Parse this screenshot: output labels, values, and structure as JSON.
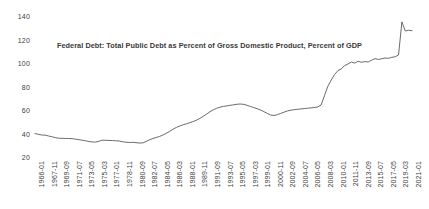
{
  "chart_data": {
    "type": "line",
    "title": "Federal Debt: Total Public Debt as Percent of Gross Domestic Product, Percent of GDP",
    "xlabel": "",
    "ylabel": "",
    "ylim": [
      20,
      140
    ],
    "yticks": [
      20,
      40,
      60,
      80,
      100,
      120,
      140
    ],
    "grid": false,
    "legend": "none",
    "line_color": "#595959",
    "xtick_labels": [
      "1966-01",
      "1967-11",
      "1969-09",
      "1971-07",
      "1973-05",
      "1975-03",
      "1977-01",
      "1978-11",
      "1980-09",
      "1982-07",
      "1984-05",
      "1986-03",
      "1988-01",
      "1989-11",
      "1991-09",
      "1993-07",
      "1995-05",
      "1997-03",
      "1999-01",
      "2000-11",
      "2002-09",
      "2004-07",
      "2006-05",
      "2008-03",
      "2010-01",
      "2011-11",
      "2013-09",
      "2015-07",
      "2017-05",
      "2019-03",
      "2021-01"
    ],
    "x": [
      "1966-01",
      "1966-07",
      "1967-01",
      "1967-07",
      "1968-01",
      "1968-07",
      "1969-01",
      "1969-07",
      "1970-01",
      "1970-07",
      "1971-01",
      "1971-07",
      "1972-01",
      "1972-07",
      "1973-01",
      "1973-07",
      "1974-01",
      "1974-07",
      "1975-01",
      "1975-07",
      "1976-01",
      "1976-07",
      "1977-01",
      "1977-07",
      "1978-01",
      "1978-07",
      "1979-01",
      "1979-07",
      "1980-01",
      "1980-07",
      "1981-01",
      "1981-07",
      "1982-01",
      "1982-07",
      "1983-01",
      "1983-07",
      "1984-01",
      "1984-07",
      "1985-01",
      "1985-07",
      "1986-01",
      "1986-07",
      "1987-01",
      "1987-07",
      "1988-01",
      "1988-07",
      "1989-01",
      "1989-07",
      "1990-01",
      "1990-07",
      "1991-01",
      "1991-07",
      "1992-01",
      "1992-07",
      "1993-01",
      "1993-07",
      "1994-01",
      "1994-07",
      "1995-01",
      "1995-07",
      "1996-01",
      "1996-07",
      "1997-01",
      "1997-07",
      "1998-01",
      "1998-07",
      "1999-01",
      "1999-07",
      "2000-01",
      "2000-07",
      "2001-01",
      "2001-07",
      "2002-01",
      "2002-07",
      "2003-01",
      "2003-07",
      "2004-01",
      "2004-07",
      "2005-01",
      "2005-07",
      "2006-01",
      "2006-07",
      "2007-01",
      "2007-07",
      "2008-01",
      "2008-07",
      "2009-01",
      "2009-07",
      "2010-01",
      "2010-07",
      "2011-01",
      "2011-07",
      "2012-01",
      "2012-07",
      "2013-01",
      "2013-07",
      "2014-01",
      "2014-07",
      "2015-01",
      "2015-07",
      "2016-01",
      "2016-07",
      "2017-01",
      "2017-07",
      "2018-01",
      "2018-07",
      "2019-01",
      "2019-07",
      "2020-01",
      "2020-04",
      "2020-07",
      "2020-10",
      "2021-01"
    ],
    "values": [
      40.0,
      39.3,
      38.7,
      38.6,
      37.9,
      37.3,
      36.5,
      36.0,
      35.9,
      35.8,
      35.8,
      35.6,
      35.2,
      34.8,
      34.3,
      33.8,
      33.2,
      32.8,
      32.7,
      33.4,
      34.3,
      34.2,
      34.1,
      34.0,
      33.8,
      33.6,
      33.0,
      32.6,
      32.4,
      32.5,
      32.2,
      31.9,
      32.0,
      33.2,
      34.6,
      35.7,
      36.6,
      37.5,
      38.7,
      40.2,
      41.8,
      43.6,
      45.2,
      46.4,
      47.4,
      48.3,
      49.2,
      50.2,
      51.4,
      52.9,
      54.7,
      56.5,
      58.6,
      60.2,
      61.5,
      62.4,
      63.1,
      63.5,
      64.0,
      64.4,
      64.9,
      65.1,
      64.8,
      64.0,
      63.0,
      62.1,
      61.1,
      60.0,
      58.6,
      57.1,
      55.8,
      55.3,
      56.0,
      57.1,
      58.2,
      59.2,
      59.8,
      60.3,
      60.6,
      60.9,
      61.2,
      61.5,
      61.8,
      62.1,
      62.6,
      64.3,
      72.2,
      80.2,
      85.5,
      90.2,
      93.5,
      95.0,
      97.8,
      99.2,
      100.8,
      99.9,
      101.5,
      100.6,
      101.2,
      100.9,
      102.4,
      103.7,
      103.0,
      103.6,
      104.2,
      104.0,
      104.8,
      105.3,
      106.8,
      135.0,
      127.2,
      127.9,
      127.5
    ]
  }
}
